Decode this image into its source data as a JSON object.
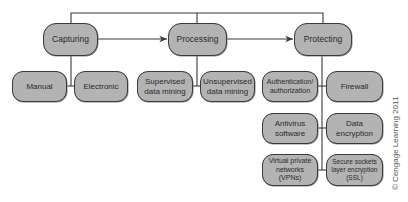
{
  "diagram": {
    "top_level": [
      {
        "id": "capturing",
        "label": "Capturing"
      },
      {
        "id": "processing",
        "label": "Processing"
      },
      {
        "id": "protecting",
        "label": "Protecting"
      }
    ],
    "capturing_children": [
      {
        "label": "Manual"
      },
      {
        "label": "Electronic"
      }
    ],
    "processing_children": [
      {
        "label": "Supervised data mining"
      },
      {
        "label": "Unsupervised data mining"
      }
    ],
    "protecting_children": [
      {
        "label": "Authentication/ authorization"
      },
      {
        "label": "Firewall"
      },
      {
        "label": "Antivirus software"
      },
      {
        "label": "Data encryption"
      },
      {
        "label": "Virtual private networks (VPNs)"
      },
      {
        "label": "Secure sockets layer encryption (SSL)"
      }
    ],
    "copyright": "© Cengage Learning 2011"
  },
  "colors": {
    "node_fill": "#b3b3b3",
    "node_border": "#3a3a3a",
    "line": "#3a3a3a"
  }
}
